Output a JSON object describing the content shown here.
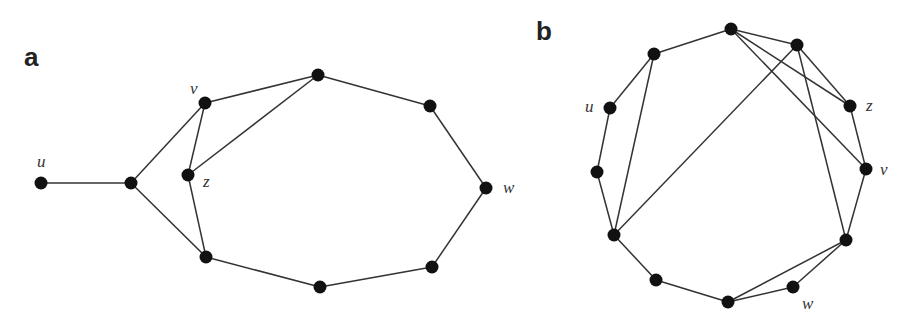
{
  "panels": [
    {
      "label": "a",
      "label_pos": [
        24,
        66
      ],
      "nodes": [
        {
          "id": "u",
          "x": 41,
          "y": 183,
          "label": "u",
          "lx": 37,
          "ly": 167
        },
        {
          "id": "p",
          "x": 131,
          "y": 183
        },
        {
          "id": "v",
          "x": 205,
          "y": 103,
          "label": "v",
          "lx": 190,
          "ly": 94
        },
        {
          "id": "z",
          "x": 188,
          "y": 175,
          "label": "z",
          "lx": 203,
          "ly": 187
        },
        {
          "id": "t",
          "x": 318,
          "y": 75
        },
        {
          "id": "r1",
          "x": 430,
          "y": 106
        },
        {
          "id": "w",
          "x": 486,
          "y": 188,
          "label": "w",
          "lx": 503,
          "ly": 193
        },
        {
          "id": "r2",
          "x": 432,
          "y": 267
        },
        {
          "id": "b",
          "x": 320,
          "y": 287
        },
        {
          "id": "l",
          "x": 206,
          "y": 257
        }
      ],
      "edges": [
        [
          "u",
          "p"
        ],
        [
          "p",
          "v"
        ],
        [
          "p",
          "l"
        ],
        [
          "v",
          "z"
        ],
        [
          "v",
          "t"
        ],
        [
          "z",
          "t"
        ],
        [
          "z",
          "l"
        ],
        [
          "t",
          "r1"
        ],
        [
          "r1",
          "w"
        ],
        [
          "w",
          "r2"
        ],
        [
          "r2",
          "b"
        ],
        [
          "b",
          "l"
        ]
      ]
    },
    {
      "label": "b",
      "label_pos": [
        536,
        40
      ],
      "nodes": [
        {
          "id": "t1",
          "x": 731,
          "y": 29
        },
        {
          "id": "t2",
          "x": 797,
          "y": 45
        },
        {
          "id": "a",
          "x": 654,
          "y": 54
        },
        {
          "id": "u",
          "x": 610,
          "y": 108,
          "label": "u",
          "lx": 585,
          "ly": 112
        },
        {
          "id": "z",
          "x": 850,
          "y": 106,
          "label": "z",
          "lx": 866,
          "ly": 111
        },
        {
          "id": "bb",
          "x": 597,
          "y": 172
        },
        {
          "id": "v",
          "x": 866,
          "y": 169,
          "label": "v",
          "lx": 880,
          "ly": 175
        },
        {
          "id": "c",
          "x": 614,
          "y": 235
        },
        {
          "id": "d",
          "x": 846,
          "y": 240
        },
        {
          "id": "e",
          "x": 656,
          "y": 280
        },
        {
          "id": "w",
          "x": 793,
          "y": 287,
          "label": "w",
          "lx": 802,
          "ly": 309
        },
        {
          "id": "f",
          "x": 728,
          "y": 302
        }
      ],
      "edges": [
        [
          "a",
          "t1"
        ],
        [
          "t1",
          "t2"
        ],
        [
          "t1",
          "z"
        ],
        [
          "t1",
          "v"
        ],
        [
          "t2",
          "z"
        ],
        [
          "t2",
          "c"
        ],
        [
          "t2",
          "d"
        ],
        [
          "a",
          "u"
        ],
        [
          "a",
          "c"
        ],
        [
          "u",
          "bb"
        ],
        [
          "bb",
          "c"
        ],
        [
          "c",
          "e"
        ],
        [
          "e",
          "f"
        ],
        [
          "f",
          "w"
        ],
        [
          "f",
          "d"
        ],
        [
          "w",
          "d"
        ],
        [
          "z",
          "v"
        ],
        [
          "v",
          "d"
        ]
      ]
    }
  ]
}
